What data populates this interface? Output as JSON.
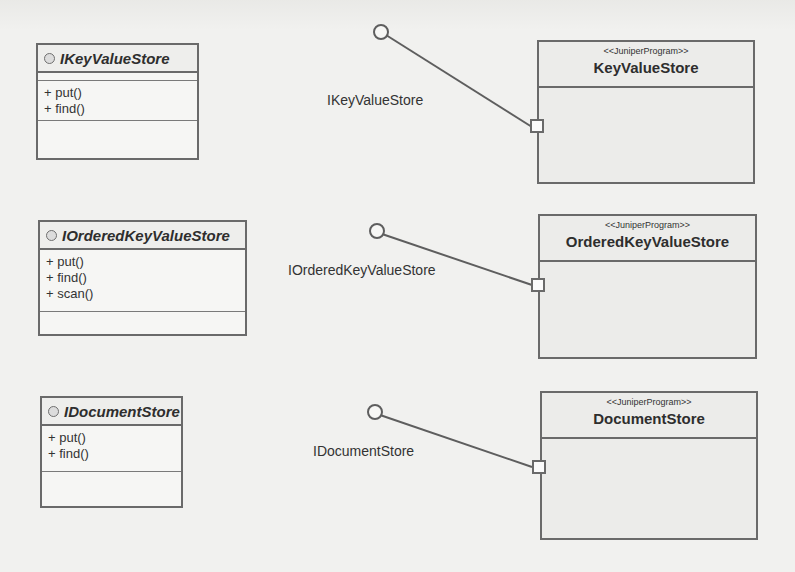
{
  "diagram": {
    "type": "UML component/interface diagram",
    "colors": {
      "background": "#f1f1ef",
      "border": "#6a6a6a",
      "component_fill": "#ececea",
      "interface_fill": "#f6f6f4",
      "text": "#2b2b2b"
    },
    "interfaces": [
      {
        "name": "IKeyValueStore",
        "icon": "interface-circle-icon",
        "operations": [
          "+ put()",
          "+ find()"
        ]
      },
      {
        "name": "IOrderedKeyValueStore",
        "icon": "interface-circle-icon",
        "operations": [
          "+ put()",
          "+ find()",
          "+ scan()"
        ]
      },
      {
        "name": "IDocumentStore",
        "icon": "interface-circle-icon",
        "operations": [
          "+ put()",
          "+ find()"
        ]
      }
    ],
    "components": [
      {
        "stereotype": "<<JuniperProgram>>",
        "name": "KeyValueStore",
        "provided_interface": "IKeyValueStore"
      },
      {
        "stereotype": "<<JuniperProgram>>",
        "name": "OrderedKeyValueStore",
        "provided_interface": "IOrderedKeyValueStore"
      },
      {
        "stereotype": "<<JuniperProgram>>",
        "name": "DocumentStore",
        "provided_interface": "IDocumentStore"
      }
    ],
    "lollipop_labels": [
      "IKeyValueStore",
      "IOrderedKeyValueStore",
      "IDocumentStore"
    ]
  }
}
